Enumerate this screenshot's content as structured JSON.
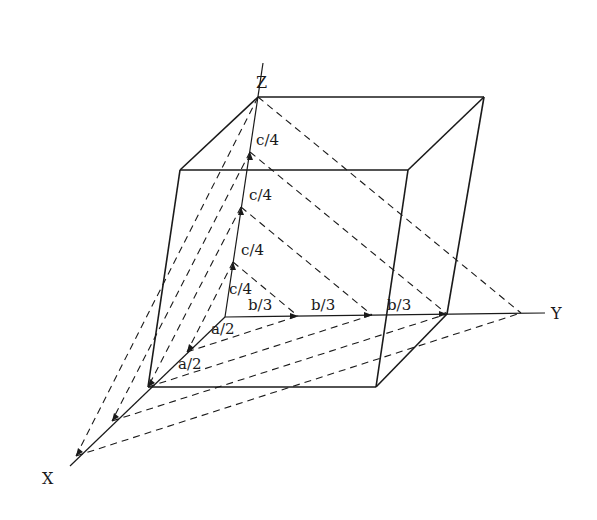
{
  "diagram": {
    "axes": {
      "x_label": "X",
      "y_label": "Y",
      "z_label": "Z"
    },
    "intercept_labels": {
      "z": [
        "c/4",
        "c/4",
        "c/4",
        "c/4"
      ],
      "y": [
        "b/3",
        "b/3",
        "b/3"
      ],
      "x": [
        "a/2",
        "a/2"
      ]
    },
    "colors": {
      "line": "#1a1a1a",
      "background": "#ffffff"
    }
  }
}
